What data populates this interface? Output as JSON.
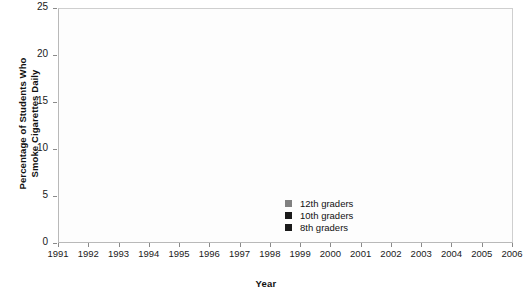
{
  "chart_data": {
    "type": "line",
    "title": "",
    "xlabel": "Year",
    "ylabel": "Percentage of Students Who\nSmoke Cigarettes Daily",
    "categories": [
      "1991",
      "1992",
      "1993",
      "1994",
      "1995",
      "1996",
      "1997",
      "1998",
      "1999",
      "2000",
      "2001",
      "2002",
      "2003",
      "2004",
      "2005",
      "2006"
    ],
    "ylim": [
      0,
      25
    ],
    "yticks": [
      0,
      5,
      10,
      15,
      20,
      25
    ],
    "ytick_labels": [
      "0",
      "5",
      "10",
      "15",
      "20",
      "25"
    ],
    "grid": true,
    "legend_position": "inside-bottom-center",
    "series": [
      {
        "name": "12th graders",
        "color": "#808080",
        "values": [
          18.5,
          16.8,
          19.0,
          19.4,
          21.2,
          22.0,
          24.5,
          22.2,
          23.2,
          20.7,
          19.0,
          16.8,
          15.8,
          15.6,
          13.6,
          12.2
        ]
      },
      {
        "name": "10th graders",
        "color": "#1a1a1a",
        "values": [
          12.5,
          12.2,
          13.8,
          14.2,
          16.6,
          18.2,
          17.8,
          15.9,
          15.8,
          14.0,
          12.2,
          10.4,
          9.1,
          8.9,
          7.5,
          7.6
        ]
      },
      {
        "name": "8th graders",
        "color": "#1a1a1a",
        "values": [
          6.9,
          6.6,
          8.1,
          8.7,
          9.3,
          10.4,
          9.0,
          8.8,
          8.6,
          7.4,
          5.6,
          5.5,
          4.6,
          4.4,
          4.0,
          4.0
        ]
      }
    ]
  },
  "legend": {
    "items": [
      {
        "label": "12th graders",
        "color": "#808080"
      },
      {
        "label": "10th graders",
        "color": "#1a1a1a"
      },
      {
        "label": "8th graders",
        "color": "#1a1a1a"
      }
    ]
  },
  "axes": {
    "y_title": "Percentage of Students Who\nSmoke Cigarettes Daily",
    "x_title": "Year"
  }
}
